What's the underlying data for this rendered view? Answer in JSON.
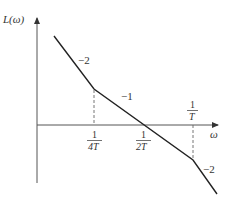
{
  "diagram": {
    "type": "bode-magnitude-asymptote",
    "y_axis_label": "L(ω)",
    "x_axis_label": "ω",
    "breakpoints": [
      {
        "label_num": "1",
        "label_den": "4T",
        "position": "below-axis"
      },
      {
        "label_num": "1",
        "label_den": "2T",
        "position": "below-axis",
        "note": "crossover"
      },
      {
        "label_num": "1",
        "label_den": "T",
        "position": "above-axis"
      }
    ],
    "slopes": [
      {
        "segment": "before 1/(4T)",
        "label": "−2"
      },
      {
        "segment": "1/(4T) to 1/T",
        "label": "−1"
      },
      {
        "segment": "after 1/T",
        "label": "−2"
      }
    ],
    "colors": {
      "line": "#222222",
      "axis": "#555555",
      "dashed": "#666666",
      "text": "#333333"
    }
  }
}
